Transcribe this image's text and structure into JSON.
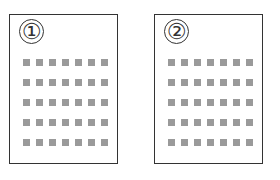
{
  "pages": [
    {
      "label": "①",
      "rows": 5,
      "cols": 7
    },
    {
      "label": "②",
      "rows": 5,
      "cols": 7
    }
  ],
  "colors": {
    "border": "#333333",
    "square": "#9a9a9a",
    "background": "#ffffff"
  }
}
